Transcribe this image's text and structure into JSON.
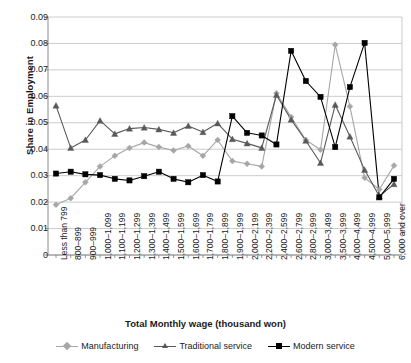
{
  "chart_data": {
    "type": "line",
    "title": "",
    "xlabel": "Total Monthly wage (thousand won)",
    "ylabel": "Share in Employment",
    "ylim": [
      0,
      0.09
    ],
    "yticks": [
      "0",
      "0.01",
      "0.02",
      "0.03",
      "0.04",
      "0.05",
      "0.06",
      "0.07",
      "0.08",
      "0.09"
    ],
    "grid": true,
    "legend_position": "bottom",
    "categories": [
      "Less than 799",
      "800–899",
      "900–999",
      "1,000–1,099",
      "1,100–1,199",
      "1,200–1,299",
      "1,300–1,399",
      "1,400–1,499",
      "1,500–1,599",
      "1,600–1,699",
      "1,700–1,799",
      "1,800–1,899",
      "1,900–1,999",
      "2,000–2,199",
      "2,200–2,399",
      "2,400–2,599",
      "2,600–2,799",
      "2,800–2,999",
      "3,000–3,499",
      "3,500–3,999",
      "4,000–4,499",
      "4,500–4,999",
      "5,000–5,999",
      "6,000 and over"
    ],
    "series": [
      {
        "name": "Manufacturing",
        "color": "#a6a6a6",
        "marker": "diamond",
        "values": [
          0.019,
          0.0215,
          0.0275,
          0.0335,
          0.0375,
          0.0405,
          0.0425,
          0.0408,
          0.0395,
          0.0412,
          0.0375,
          0.0435,
          0.0355,
          0.0345,
          0.0335,
          0.0612,
          0.0522,
          0.0435,
          0.0398,
          0.0795,
          0.0562,
          0.0292,
          0.0248,
          0.0338
        ]
      },
      {
        "name": "Traditional service",
        "color": "#595959",
        "marker": "triangle",
        "values": [
          0.0565,
          0.0405,
          0.0435,
          0.0508,
          0.0458,
          0.0478,
          0.0482,
          0.0475,
          0.0462,
          0.0488,
          0.0465,
          0.0498,
          0.0438,
          0.0422,
          0.0405,
          0.0605,
          0.0512,
          0.0432,
          0.0348,
          0.0568,
          0.0448,
          0.0322,
          0.0222,
          0.0268
        ]
      },
      {
        "name": "Modern service",
        "color": "#000000",
        "marker": "square",
        "values": [
          0.0308,
          0.0315,
          0.0305,
          0.0302,
          0.0288,
          0.0282,
          0.0298,
          0.0315,
          0.0288,
          0.0275,
          0.0302,
          0.0278,
          0.0525,
          0.0462,
          0.0452,
          0.0418,
          0.0772,
          0.0658,
          0.0598,
          0.0408,
          0.0635,
          0.0802,
          0.0218,
          0.0288
        ]
      }
    ]
  },
  "legend": {
    "items": [
      {
        "label": "Manufacturing"
      },
      {
        "label": "Traditional service"
      },
      {
        "label": "Modern service"
      }
    ]
  },
  "axes": {
    "y_title": "Share in Employment",
    "x_title": "Total Monthly wage (thousand won)"
  }
}
